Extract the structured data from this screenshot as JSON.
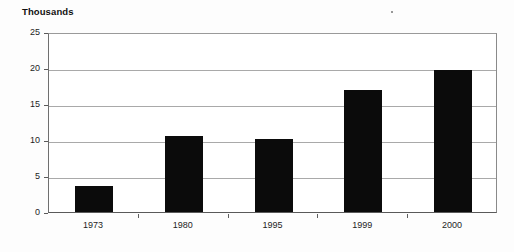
{
  "chart_data": {
    "type": "bar",
    "title": "",
    "axis_unit_label": "Thousands",
    "categories": [
      "1973",
      "1980",
      "1995",
      "1999",
      "2000"
    ],
    "values": [
      3.6,
      10.6,
      10.2,
      16.9,
      19.7
    ],
    "series": [
      {
        "name": "",
        "values": [
          3.6,
          10.6,
          10.2,
          16.9,
          19.7
        ]
      }
    ],
    "xlabel": "",
    "ylabel": "Thousands",
    "ylim": [
      0,
      25
    ],
    "yticks": [
      0,
      5,
      10,
      15,
      20,
      25
    ],
    "ytick_labels": [
      "0",
      "5",
      "10",
      "15",
      "20",
      "25"
    ],
    "grid": true,
    "grid_axis": "y",
    "legend": false,
    "legend_position": "none",
    "bar_color": "#0b0b0b",
    "gridline_color": "#a9a9a9",
    "axis_color": "#5a5a5a",
    "background_color": "#ffffff"
  }
}
